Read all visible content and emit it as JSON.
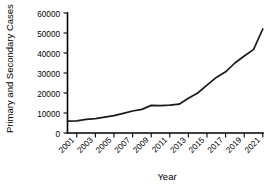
{
  "chart_data": {
    "type": "line",
    "title": "",
    "xlabel": "Year",
    "ylabel": "Primary and Secondary Cases",
    "xlim": [
      2000,
      2021
    ],
    "ylim": [
      0,
      60000
    ],
    "grid": false,
    "legend": null,
    "ytick_labels": [
      "60000",
      "50000",
      "40000",
      "30000",
      "20000",
      "10000",
      "0"
    ],
    "ytick_values": [
      60000,
      50000,
      40000,
      30000,
      20000,
      10000,
      0
    ],
    "xtick_labels": [
      "2001",
      "2003",
      "2005",
      "2007",
      "2009",
      "2011",
      "2013",
      "2015",
      "2017",
      "2019",
      "2021"
    ],
    "xtick_values": [
      2001,
      2003,
      2005,
      2007,
      2009,
      2011,
      2013,
      2015,
      2017,
      2019,
      2021
    ],
    "series": [
      {
        "name": "Primary and Secondary Cases",
        "color": "#1a1a1a",
        "x": [
          2000,
          2001,
          2002,
          2003,
          2004,
          2005,
          2006,
          2007,
          2008,
          2009,
          2010,
          2011,
          2012,
          2013,
          2014,
          2015,
          2016,
          2017,
          2018,
          2019,
          2020,
          2021
        ],
        "values": [
          5900,
          6100,
          6800,
          7200,
          7900,
          8700,
          9800,
          11000,
          11800,
          13800,
          13700,
          13900,
          14400,
          17400,
          20000,
          23900,
          27800,
          30600,
          35000,
          38500,
          41700,
          52000
        ]
      }
    ]
  },
  "axes": {
    "y_title": "Primary and Secondary Cases",
    "x_title": "Year"
  }
}
